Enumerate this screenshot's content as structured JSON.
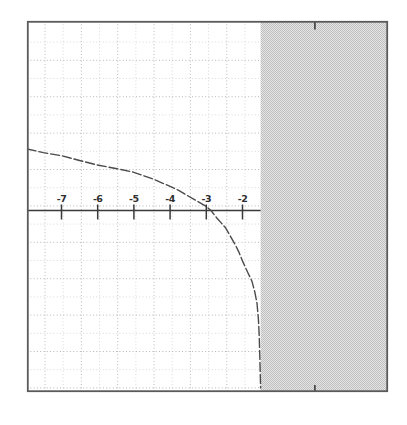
{
  "figure": {
    "background": "#ffffff"
  },
  "axis": {
    "tick_labels": [
      "-7",
      "-6",
      "-5",
      "-4",
      "-3",
      "-2"
    ],
    "color": "#3a3a3a"
  },
  "origin_markers": {
    "x_value": 0,
    "positions": [
      "top-edge",
      "bottom-edge"
    ]
  },
  "colors": {
    "border": "#5a5a5a",
    "axis": "#3a3a3a",
    "grid_major": "#b7b7b7",
    "grid_minor": "#d8d8d8",
    "curve": "#4a4a4a",
    "shade_dark": "#bfbfbf",
    "shade_light": "#e5e5e5"
  },
  "chart_data": {
    "type": "line",
    "title": "",
    "xlabel": "",
    "ylabel": "",
    "x_range": [
      -8,
      2
    ],
    "y_range": [
      -5,
      5.2
    ],
    "x_ticks": [
      -7,
      -6,
      -5,
      -4,
      -3,
      -2
    ],
    "grid": "dotted graph paper, 0.5-unit pitch",
    "legend": "none",
    "asymptote_x": -1.5,
    "x_intercept": -2.9,
    "shaded_region": {
      "x_start": -1.5,
      "x_end": 2,
      "meaning": "excluded region / outside domain",
      "fill": "gray halftone"
    },
    "series": [
      {
        "name": "curve",
        "style": "dashed",
        "points": [
          [
            -7.95,
            1.7
          ],
          [
            -7.5,
            1.6
          ],
          [
            -6.99,
            1.51
          ],
          [
            -6.5,
            1.38
          ],
          [
            -6.02,
            1.26
          ],
          [
            -5.5,
            1.16
          ],
          [
            -5.02,
            1.06
          ],
          [
            -4.5,
            0.88
          ],
          [
            -4.03,
            0.68
          ],
          [
            -3.75,
            0.55
          ],
          [
            -3.5,
            0.4
          ],
          [
            -3.25,
            0.26
          ],
          [
            -3.01,
            0.12
          ],
          [
            -2.87,
            0.0
          ],
          [
            -2.7,
            -0.22
          ],
          [
            -2.6,
            -0.33
          ],
          [
            -2.48,
            -0.46
          ],
          [
            -2.35,
            -0.68
          ],
          [
            -2.2,
            -0.95
          ],
          [
            -2.1,
            -1.15
          ],
          [
            -1.99,
            -1.42
          ],
          [
            -1.85,
            -1.72
          ],
          [
            -1.74,
            -1.95
          ],
          [
            -1.66,
            -2.25
          ],
          [
            -1.6,
            -2.56
          ],
          [
            -1.56,
            -3.0
          ],
          [
            -1.54,
            -3.44
          ],
          [
            -1.52,
            -4.13
          ],
          [
            -1.5,
            -4.9
          ]
        ]
      }
    ]
  }
}
